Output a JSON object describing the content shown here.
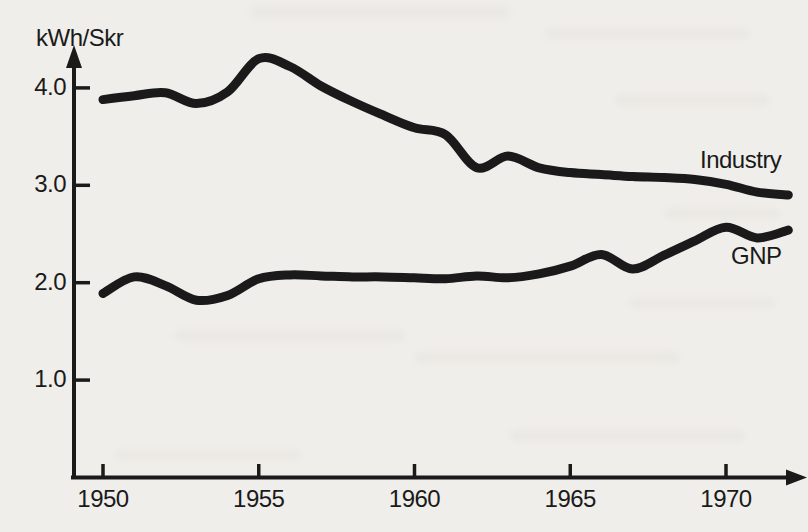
{
  "figure": {
    "ink_color": "#1a1a1a",
    "paper_color": "#f0eeea"
  },
  "chart_data": {
    "type": "line",
    "title": "",
    "ylabel": "kWh/Skr",
    "xlabel": "",
    "x": [
      1950,
      1951,
      1952,
      1953,
      1954,
      1955,
      1956,
      1957,
      1958,
      1959,
      1960,
      1961,
      1962,
      1963,
      1964,
      1965,
      1966,
      1967,
      1968,
      1969,
      1970,
      1971,
      1972
    ],
    "series": [
      {
        "name": "Industry",
        "values": [
          3.88,
          3.92,
          3.95,
          3.84,
          3.96,
          4.3,
          4.22,
          4.02,
          3.86,
          3.72,
          3.59,
          3.52,
          3.18,
          3.3,
          3.18,
          3.13,
          3.11,
          3.09,
          3.08,
          3.06,
          3.01,
          2.93,
          2.9
        ]
      },
      {
        "name": "GNP",
        "values": [
          1.89,
          2.06,
          1.97,
          1.82,
          1.87,
          2.04,
          2.08,
          2.07,
          2.06,
          2.06,
          2.05,
          2.04,
          2.07,
          2.05,
          2.09,
          2.17,
          2.29,
          2.14,
          2.28,
          2.43,
          2.57,
          2.46,
          2.54
        ]
      }
    ],
    "xticks": [
      {
        "value": 1950,
        "label": "1950"
      },
      {
        "value": 1955,
        "label": "1955"
      },
      {
        "value": 1960,
        "label": "1960"
      },
      {
        "value": 1965,
        "label": "1965"
      },
      {
        "value": 1970,
        "label": "1970"
      }
    ],
    "yticks": [
      {
        "value": 4.0,
        "label": "4.0"
      },
      {
        "value": 3.0,
        "label": "3.0"
      },
      {
        "value": 2.0,
        "label": "2.0"
      },
      {
        "value": 1.0,
        "label": "1.0"
      }
    ],
    "xlim": [
      1950,
      1972
    ],
    "ylim": [
      0,
      4.6
    ],
    "grid": false,
    "legend_position": "inline-right"
  }
}
